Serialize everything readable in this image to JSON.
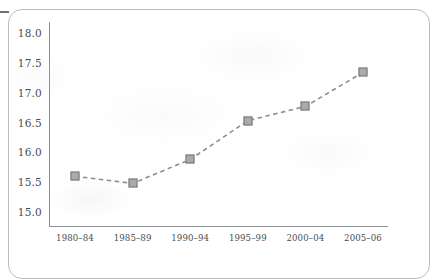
{
  "figure": {
    "frame_label": "figure-border",
    "edge_mark": "left-edge-tick"
  },
  "chart_data": {
    "type": "line",
    "title": "",
    "subtitle": "",
    "xlabel": "",
    "ylabel": "",
    "categories": [
      "1980–84",
      "1985–89",
      "1990–94",
      "1995–99",
      "2000–04",
      "2005–06"
    ],
    "values": [
      15.6,
      15.48,
      15.88,
      16.53,
      16.77,
      17.34
    ],
    "series": [
      {
        "name": "",
        "values": [
          15.6,
          15.48,
          15.88,
          16.53,
          16.77,
          17.34
        ]
      }
    ],
    "ylim": [
      15.0,
      18.0
    ],
    "ytick_labels": [
      "18.0",
      "17.5",
      "17.0",
      "16.5",
      "16.0",
      "15.5",
      "15.0"
    ],
    "ytick_values": [
      18.0,
      17.5,
      17.0,
      16.5,
      16.0,
      15.5,
      15.0
    ],
    "xtick_labels": [
      "1980–84",
      "1985–89",
      "1990–94",
      "1995–99",
      "2000–04",
      "2005–06"
    ],
    "grid": false,
    "legend": "none",
    "line_style": "dashed",
    "marker_style": "square",
    "colors": {
      "line": "#8b8e90",
      "marker_fill": "#a8aaac",
      "marker_edge": "#76797b",
      "axis": "#8e9193",
      "text": "#4a4d4f",
      "frame": "#b9bbbd",
      "background": "#ffffff"
    }
  }
}
